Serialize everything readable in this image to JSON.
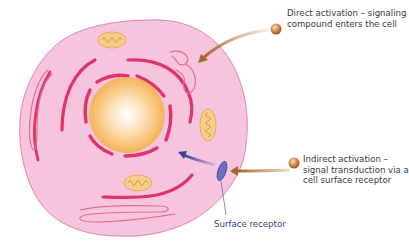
{
  "diagram": {
    "type": "cell-signaling-illustration",
    "labels": {
      "direct_activation": "Direct activation – signaling compound enters the cell",
      "indirect_activation": "Indirect activation – signal transduction via a cell surface receptor",
      "surface_receptor": "Surface receptor"
    },
    "colors": {
      "cytoplasm": "#f6c4dc",
      "membrane_outline": "#d8709c",
      "er_membrane": "#e0336a",
      "nucleus_center": "#fff8ee",
      "nucleus_edge": "#f3b45a",
      "mitochondria": "#f5cf8a",
      "brown_arrow": "#a8652a",
      "blue_arrow": "#3b3f9a",
      "receptor": "#6a6fc0",
      "text": "#3a3a3a",
      "receptor_text": "#3d4184"
    }
  }
}
